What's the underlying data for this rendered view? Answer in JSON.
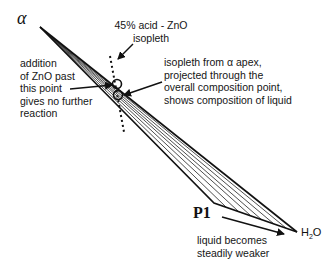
{
  "diagram": {
    "apex_label": "α",
    "point_label": "P1",
    "water_label": {
      "main": "H",
      "sub": "2",
      "tail": "O"
    },
    "annotations": {
      "isopleth_45": [
        "45% acid - ZnO",
        "isopleth"
      ],
      "addition": [
        "addition",
        "of ZnO past",
        "this point",
        "gives no further",
        "reaction"
      ],
      "isopleth_alpha": [
        "isopleth from α apex,",
        "projected through the",
        "overall composition point,",
        "shows composition of liquid"
      ],
      "liquid": [
        "liquid becomes",
        "steadily weaker"
      ]
    },
    "geometry": {
      "apex": [
        40,
        27
      ],
      "p1": [
        214,
        203
      ],
      "h2o": [
        297,
        232
      ],
      "tie_line_count": 6,
      "circles": [
        [
          117,
          84
        ],
        [
          118,
          95
        ]
      ],
      "dotted_isopleth": [
        [
          110,
          56
        ],
        [
          124,
          132
        ]
      ]
    }
  }
}
